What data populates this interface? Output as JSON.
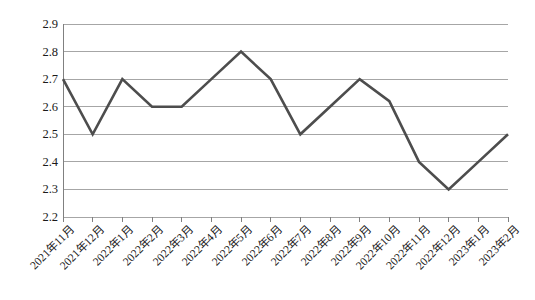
{
  "chart_data": {
    "type": "line",
    "title": "",
    "subtitle": "",
    "xlabel": "",
    "ylabel": "",
    "categories": [
      "2021年11月",
      "2021年12月",
      "2022年1月",
      "2022年2月",
      "2022年3月",
      "2022年4月",
      "2022年5月",
      "2022年6月",
      "2022年7月",
      "2022年8月",
      "2022年9月",
      "2022年10月",
      "2022年11月",
      "2022年12月",
      "2023年1月",
      "2023年2月"
    ],
    "values": [
      2.7,
      2.5,
      2.7,
      2.6,
      2.6,
      2.7,
      2.8,
      2.7,
      2.5,
      2.6,
      2.7,
      2.62,
      2.4,
      2.3,
      2.4,
      2.5
    ],
    "ylim": [
      2.2,
      2.9
    ],
    "yticks": [
      "2.9",
      "2.8",
      "2.7",
      "2.6",
      "2.5",
      "2.4",
      "2.3",
      "2.2"
    ],
    "ytick_values": [
      2.9,
      2.8,
      2.7,
      2.6,
      2.5,
      2.4,
      2.3,
      2.2
    ],
    "grid": true,
    "grid_axis": "y",
    "legend": false,
    "legend_position": "none",
    "series": [
      {
        "name": "",
        "values": [
          2.7,
          2.5,
          2.7,
          2.6,
          2.6,
          2.7,
          2.8,
          2.7,
          2.5,
          2.6,
          2.7,
          2.62,
          2.4,
          2.3,
          2.4,
          2.5
        ],
        "color": "#4d4d4d",
        "marker": "none",
        "line_width": 2.6
      }
    ],
    "colors": {
      "line": "#4d4d4d",
      "grid": "#a6a6a6",
      "axis": "#808080",
      "text": "#1a1a1a",
      "background": "#ffffff"
    },
    "annotations": []
  }
}
